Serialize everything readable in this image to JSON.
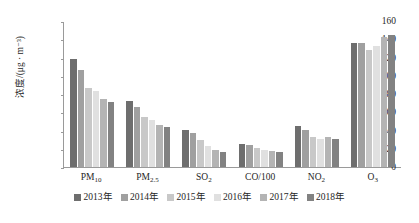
{
  "chart_data": {
    "type": "bar",
    "title": "",
    "xlabel": "",
    "ylabel": "浓度/(μg · m⁻³)",
    "ylim": [
      0,
      160
    ],
    "ytick_step": 20,
    "yticks": [
      160,
      140,
      120,
      100,
      80,
      60,
      40,
      20,
      0
    ],
    "grid": false,
    "legend_position": "bottom",
    "categories": [
      "PM10",
      "PM2.5",
      "SO2",
      "CO/100",
      "NO2",
      "O3"
    ],
    "category_labels": [
      {
        "base": "PM",
        "sub": "10"
      },
      {
        "base": "PM",
        "sub": "2.5"
      },
      {
        "base": "SO",
        "sub": "2"
      },
      {
        "base": "CO/100",
        "sub": ""
      },
      {
        "base": "NO",
        "sub": "2"
      },
      {
        "base": "O",
        "sub": "3"
      }
    ],
    "series": [
      {
        "name": "2013年",
        "color": "#6e6e6e",
        "values": [
          118,
          72,
          41,
          25,
          45,
          136
        ]
      },
      {
        "name": "2014年",
        "color": "#a0a0a0",
        "values": [
          106,
          66,
          37,
          24,
          41,
          136
        ]
      },
      {
        "name": "2015年",
        "color": "#c8c8c8",
        "values": [
          87,
          55,
          30,
          21,
          33,
          128
        ]
      },
      {
        "name": "2016年",
        "color": "#e0e0e0",
        "values": [
          83,
          52,
          23,
          19,
          31,
          133
        ]
      },
      {
        "name": "2017年",
        "color": "#b4b4b4",
        "values": [
          74,
          46,
          19,
          18,
          33,
          143
        ]
      },
      {
        "name": "2018年",
        "color": "#828282",
        "values": [
          71,
          44,
          17,
          17,
          31,
          145
        ]
      }
    ]
  }
}
